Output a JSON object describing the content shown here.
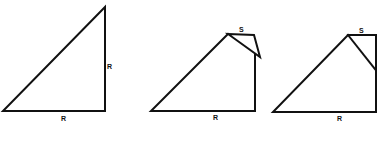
{
  "diagram": {
    "colors": {
      "stroke": "#111111",
      "background": "#ffffff"
    },
    "figures": [
      {
        "id": "figure-1",
        "shape": "right-triangle",
        "labels": {
          "bottom": "R",
          "right": "R"
        }
      },
      {
        "id": "figure-2",
        "shape": "triangle-with-flipped-corner",
        "labels": {
          "top": "S",
          "bottom": "R"
        }
      },
      {
        "id": "figure-3",
        "shape": "triangle-with-folded-corner",
        "labels": {
          "top": "S",
          "bottom": "R"
        }
      }
    ]
  }
}
